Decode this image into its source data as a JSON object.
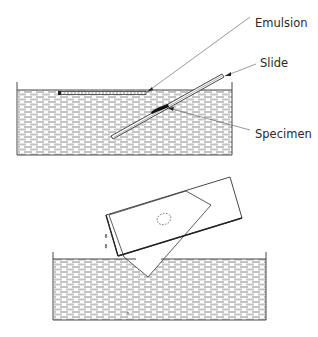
{
  "figure": {
    "top_panel": {
      "description": "Emulsion floating on water surface being picked up onto an inclined slide carrying a specimen",
      "labels": {
        "emulsion": "Emulsion",
        "slide": "Slide",
        "specimen": "Specimen"
      }
    },
    "bottom_panel": {
      "description": "Slide lifted out of the water with emulsion sheet adhering, excess draining off in drops"
    }
  },
  "colors": {
    "ink": "#333333",
    "water_hatch": "#777777",
    "background": "#ffffff"
  }
}
